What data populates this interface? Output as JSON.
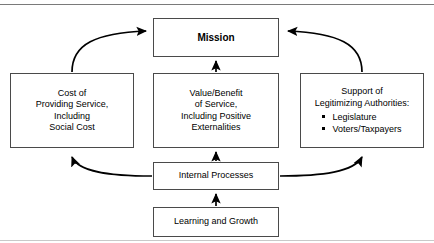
{
  "figure": {
    "top_rule": true,
    "bottom_rule": true,
    "line_color": "#000000",
    "box_border_color": "#4a4a4a",
    "background": "#ffffff"
  },
  "nodes": {
    "mission": {
      "label": "Mission",
      "lines": [
        "Mission"
      ]
    },
    "cost": {
      "label": "Cost of Providing Service, Including Social Cost",
      "lines": [
        "Cost of",
        "Providing Service,",
        "Including",
        "Social Cost"
      ]
    },
    "value": {
      "label": "Value/Benefit of Service, Including Positive Externalities",
      "lines": [
        "Value/Benefit",
        "of Service,",
        "Including Positive",
        "Externalities"
      ]
    },
    "support": {
      "label": "Support of Legitimizing Authorities",
      "lines": [
        "Support of",
        "Legitimizing Authorities:"
      ],
      "bullets": [
        "Legislature",
        "Voters/Taxpayers"
      ]
    },
    "internal": {
      "label": "Internal Processes",
      "lines": [
        "Internal Processes"
      ]
    },
    "learning": {
      "label": "Learning and Growth",
      "lines": [
        "Learning and Growth"
      ]
    }
  },
  "edges": [
    {
      "name": "cost-to-mission",
      "from": "cost",
      "to": "mission",
      "style": "curved",
      "arrow": "end"
    },
    {
      "name": "support-to-mission",
      "from": "support",
      "to": "mission",
      "style": "curved",
      "arrow": "end"
    },
    {
      "name": "value-to-mission",
      "from": "value",
      "to": "mission",
      "style": "straight",
      "arrow": "end"
    },
    {
      "name": "internal-to-cost",
      "from": "internal",
      "to": "cost",
      "style": "curved",
      "arrow": "end"
    },
    {
      "name": "internal-to-support",
      "from": "internal",
      "to": "support",
      "style": "curved",
      "arrow": "end"
    },
    {
      "name": "internal-to-value",
      "from": "internal",
      "to": "value",
      "style": "straight",
      "arrow": "end"
    },
    {
      "name": "learning-to-internal",
      "from": "learning",
      "to": "internal",
      "style": "straight",
      "arrow": "end"
    }
  ]
}
